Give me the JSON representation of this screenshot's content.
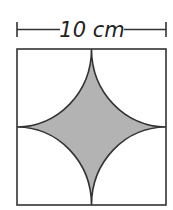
{
  "diagram": {
    "dimension_label": "10 cm",
    "square_side": "10 cm",
    "shape": "square with four quarter-circle arcs centered at corners, shaded concave star region in center",
    "colors": {
      "stroke": "#333333",
      "shaded_fill": "#b3b3b3",
      "background": "#ffffff"
    }
  }
}
